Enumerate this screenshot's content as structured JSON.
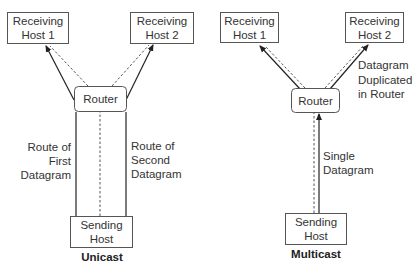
{
  "unicast": {
    "caption": "Unicast",
    "receiver1": {
      "line1": "Receiving",
      "line2": "Host 1"
    },
    "receiver2": {
      "line1": "Receiving",
      "line2": "Host 2"
    },
    "router": "Router",
    "sender": {
      "line1": "Sending",
      "line2": "Host"
    },
    "route_first": {
      "line1": "Route of",
      "line2": "First",
      "line3": "Datagram"
    },
    "route_second": {
      "line1": "Route of",
      "line2": "Second",
      "line3": "Datagram"
    }
  },
  "multicast": {
    "caption": "Multicast",
    "receiver1": {
      "line1": "Receiving",
      "line2": "Host 1"
    },
    "receiver2": {
      "line1": "Receiving",
      "line2": "Host 2"
    },
    "router": "Router",
    "sender": {
      "line1": "Sending",
      "line2": "Host"
    },
    "duplicated_note": {
      "line1": "Datagram",
      "line2": "Duplicated",
      "line3": "in Router"
    },
    "single_note": {
      "line1": "Single",
      "line2": "Datagram"
    }
  }
}
